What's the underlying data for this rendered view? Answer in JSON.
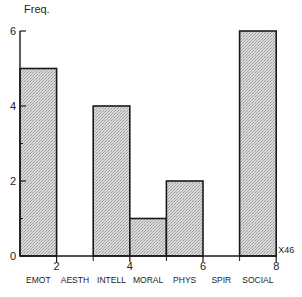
{
  "chart_data": {
    "type": "bar",
    "title": "",
    "ylabel": "Freq.",
    "xlabel": "",
    "x_multiplier_label": "X46",
    "categories": [
      "EMOT",
      "AESTH",
      "INTELL",
      "MORAL",
      "PHYS",
      "SPIR",
      "SOCIAL"
    ],
    "values": [
      5,
      0,
      4,
      1,
      2,
      0,
      6
    ],
    "ylim": [
      0,
      6
    ],
    "y_major_ticks": [
      0,
      2,
      4,
      6
    ],
    "y_minor_ticks": [
      1,
      3,
      5
    ],
    "xlim": [
      1,
      8
    ],
    "x_tick_labels": [
      2,
      4,
      6,
      8
    ],
    "x_minor_ticks": [
      3,
      5,
      7
    ],
    "bar_fill": "#cfcfcf",
    "bar_stroke": "#1a1a1a",
    "grid": false,
    "legend": null
  }
}
